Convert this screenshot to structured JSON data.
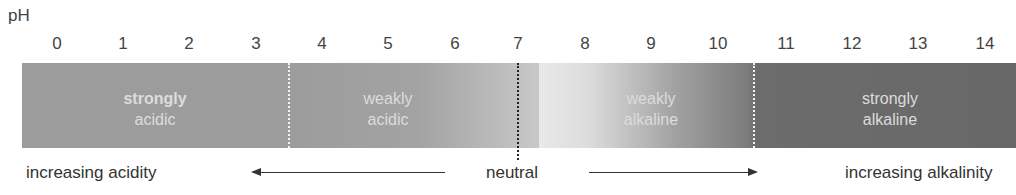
{
  "axis": {
    "label": "pH",
    "ticks": [
      "0",
      "1",
      "2",
      "3",
      "4",
      "5",
      "6",
      "7",
      "8",
      "9",
      "10",
      "11",
      "12",
      "13",
      "14"
    ]
  },
  "segments": [
    {
      "line1": "strongly",
      "line2": "acidic"
    },
    {
      "line1": "weakly",
      "line2": "acidic"
    },
    {
      "line1": "weakly",
      "line2": "alkaline"
    },
    {
      "line1": "strongly",
      "line2": "alkaline"
    }
  ],
  "bottom": {
    "left": "increasing acidity",
    "center": "neutral",
    "right": "increasing alkalinity"
  },
  "colors": {
    "strongly_acidic": "#9c9c9c",
    "neutral": "#e9e9e9",
    "strongly_alkaline": "#686868"
  }
}
